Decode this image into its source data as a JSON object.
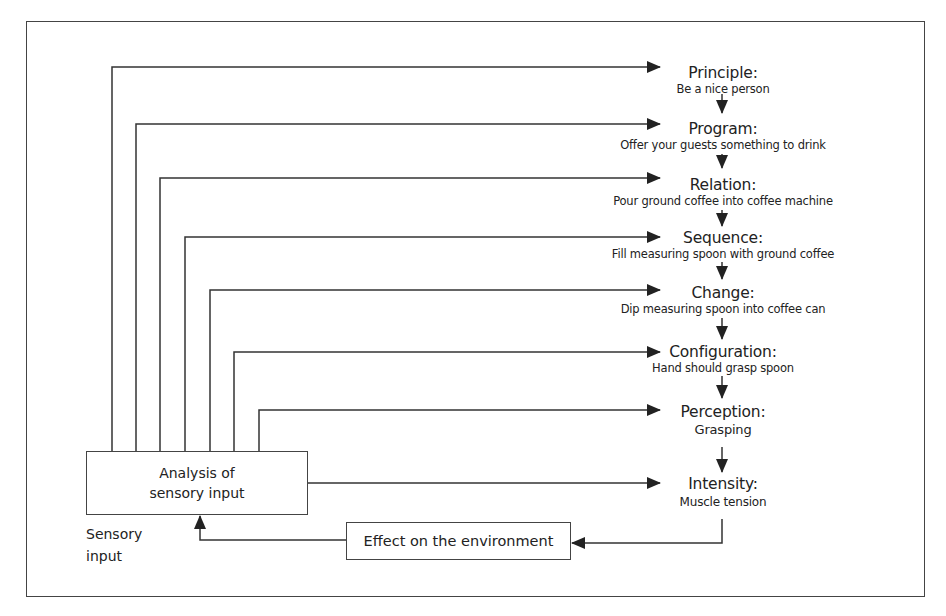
{
  "diagram": {
    "levels": [
      {
        "title": "Principle:",
        "desc": "Be a nice person"
      },
      {
        "title": "Program:",
        "desc": "Offer your guests something to drink"
      },
      {
        "title": "Relation:",
        "desc": "Pour ground coffee into coffee machine"
      },
      {
        "title": "Sequence:",
        "desc": "Fill measuring spoon with ground coffee"
      },
      {
        "title": "Change:",
        "desc": "Dip measuring spoon into coffee can"
      },
      {
        "title": "Configuration:",
        "desc": "Hand should grasp spoon"
      },
      {
        "title": "Perception:",
        "desc": "Grasping"
      },
      {
        "title": "Intensity:",
        "desc": "Muscle tension"
      }
    ],
    "analysis_box": {
      "line1": "Analysis of",
      "line2": "sensory input"
    },
    "effect_box": "Effect on the environment",
    "sensory_label": {
      "line1": "Sensory",
      "line2": "input"
    },
    "colors": {
      "line": "#333333",
      "background": "#ffffff",
      "text": "#222222"
    }
  }
}
